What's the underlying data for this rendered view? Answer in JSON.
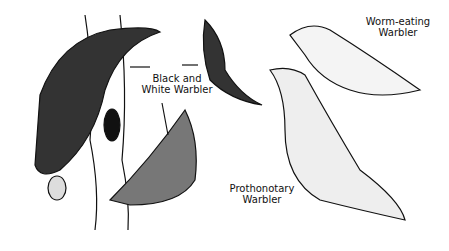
{
  "illustration": {
    "labels": {
      "black_and_white": {
        "line1": "Black and",
        "line2": "White Warbler"
      },
      "worm_eating": {
        "line1": "Worm-eating",
        "line2": "Warbler"
      },
      "prothonotary": {
        "line1": "Prothonotary",
        "line2": "Warbler"
      }
    },
    "colors": {
      "ink": "#111111",
      "paper": "#ffffff"
    }
  }
}
